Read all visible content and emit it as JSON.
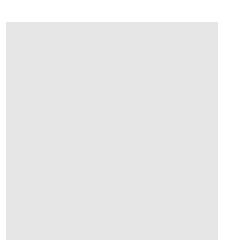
{
  "board": {
    "background": "#e6e6e6",
    "line_color": "#555555",
    "columns_x": [
      25,
      45.5,
      66,
      86.5,
      107,
      127.5,
      148,
      168.5,
      189,
      209.5
    ],
    "rows_y": [
      32,
      53,
      74,
      95,
      116,
      136.5,
      157,
      178,
      199,
      220
    ],
    "right_edge_x": 218,
    "star_points": [
      [
        3,
        0
      ],
      [
        9,
        0
      ],
      [
        9,
        6
      ]
    ]
  },
  "stones": [
    {
      "color": "white",
      "col": 1,
      "row": 3
    },
    {
      "color": "white",
      "col": 1,
      "row": 5
    },
    {
      "color": "white",
      "col": 2,
      "row": 5
    },
    {
      "color": "white",
      "col": 3,
      "row": 5
    },
    {
      "color": "black",
      "col": 0,
      "row": 6
    },
    {
      "color": "black",
      "col": 1,
      "row": 6
    },
    {
      "color": "black",
      "col": 2,
      "row": 6
    },
    {
      "color": "white",
      "col": 3,
      "row": 6
    },
    {
      "color": "white",
      "col": 0,
      "row": 7
    },
    {
      "color": "black",
      "col": 2,
      "row": 7
    },
    {
      "color": "white",
      "col": 3,
      "row": 7
    },
    {
      "color": "white",
      "col": 3,
      "row": 8
    },
    {
      "color": "black",
      "col": 1,
      "row": 9
    },
    {
      "color": "black",
      "col": 2,
      "row": 9
    },
    {
      "color": "white",
      "col": 3,
      "row": 9
    }
  ]
}
